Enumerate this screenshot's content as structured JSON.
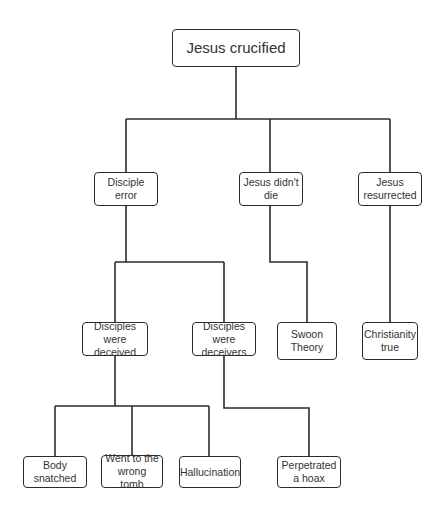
{
  "diagram": {
    "type": "tree",
    "root": "Jesus crucified",
    "nodes": {
      "root": {
        "label": "Jesus crucified"
      },
      "disciple_error": {
        "label": "Disciple error",
        "parent": "root"
      },
      "jesus_didnt_die": {
        "label": "Jesus didn't die",
        "parent": "root"
      },
      "jesus_resurrected": {
        "label": "Jesus resurrected",
        "parent": "root"
      },
      "disciples_deceived": {
        "label": "Disciples were deceived",
        "parent": "disciple_error"
      },
      "disciples_deceivers": {
        "label": "Disciples were deceivers",
        "parent": "disciple_error"
      },
      "swoon_theory": {
        "label": "Swoon Theory",
        "parent": "jesus_didnt_die"
      },
      "christianity_true": {
        "label": "Christianity true",
        "parent": "jesus_resurrected"
      },
      "body_snatched": {
        "label": "Body snatched",
        "parent": "disciples_deceived"
      },
      "wrong_tomb": {
        "label": "Went to the wrong tomb",
        "parent": "disciples_deceived"
      },
      "hallucination": {
        "label": "Hallucination",
        "parent": "disciples_deceived"
      },
      "perpetrated_hoax": {
        "label": "Perpetrated a hoax",
        "parent": "disciples_deceivers"
      }
    },
    "colors": {
      "line": "#2b2b2b",
      "box_border": "#2b2b2b",
      "text": "#333333",
      "background": "#ffffff"
    }
  }
}
